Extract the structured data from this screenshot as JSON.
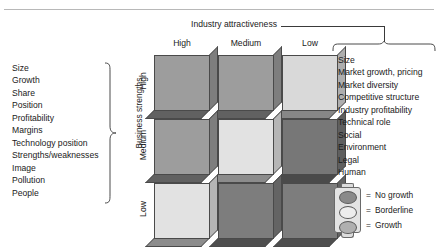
{
  "diagram": {
    "title_industry_axis": "Industry attractiveness",
    "title_business_axis": "Business strengths"
  },
  "business_strengths": {
    "label": "Business strengths",
    "criteria": [
      "Size",
      "Growth",
      "Share",
      "Position",
      "Profitability",
      "Margins",
      "Technology position",
      "Strengths/weaknesses",
      "Image",
      "Pollution",
      "People"
    ]
  },
  "industry_attractiveness": {
    "label": "Industry attractiveness",
    "criteria": [
      "Size",
      "Market growth, pricing",
      "Market diversity",
      "Competitive structure",
      "Industry profitability",
      "Technical role",
      "Social",
      "Environment",
      "Legal",
      "Human"
    ]
  },
  "matrix": {
    "column_headers": [
      "High",
      "Medium",
      "Low"
    ],
    "row_headers": [
      "High",
      "Medium",
      "Low"
    ],
    "cells": [
      [
        {
          "row": "High",
          "column": "High",
          "status": "Growth",
          "color": "#9d9d9d"
        },
        {
          "row": "High",
          "column": "Medium",
          "status": "Growth",
          "color": "#9d9d9d"
        },
        {
          "row": "High",
          "column": "Low",
          "status": "Borderline",
          "color": "#d9d9d9"
        }
      ],
      [
        {
          "row": "Medium",
          "column": "High",
          "status": "Growth",
          "color": "#9d9d9d"
        },
        {
          "row": "Medium",
          "column": "Medium",
          "status": "Borderline",
          "color": "#e2e2e2"
        },
        {
          "row": "Medium",
          "column": "Low",
          "status": "No growth",
          "color": "#777777"
        }
      ],
      [
        {
          "row": "Low",
          "column": "High",
          "status": "Borderline",
          "color": "#e2e2e2"
        },
        {
          "row": "Low",
          "column": "Medium",
          "status": "No growth",
          "color": "#7d7d7d"
        },
        {
          "row": "Low",
          "column": "Low",
          "status": "No growth",
          "color": "#7d7d7d"
        }
      ]
    ]
  },
  "legend": {
    "equals": "=",
    "items": [
      {
        "label": "No growth",
        "color": "#8a8a8a"
      },
      {
        "label": "Borderline",
        "color": "#ededed"
      },
      {
        "label": "Growth",
        "color": "#b0b0b0"
      }
    ]
  }
}
